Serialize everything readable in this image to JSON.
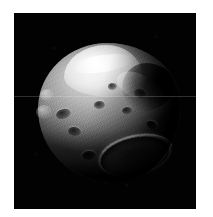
{
  "page": {
    "background_color": "#ffffff",
    "width": 213,
    "height": 217
  },
  "image_frame": {
    "label": "asteroid-nucleus-image",
    "background_color": "#020202",
    "left": 14,
    "top": 13,
    "width": 182,
    "height": 196,
    "caption": ""
  },
  "subject": {
    "name": "asteroid-nucleus",
    "description": "Irregular rocky body imaged in grayscale against black space background",
    "highlight_color": "#e2e2e2",
    "midtone_color": "#8f8f8f",
    "shadow_color": "#1a1a1a",
    "features": [
      {
        "name": "upper-dome-lobe",
        "tone": "bright"
      },
      {
        "name": "summit-ridge",
        "tone": "highlight"
      },
      {
        "name": "upper-right-scarp-shadow",
        "tone": "dark"
      },
      {
        "name": "lower-right-crater",
        "tone": "bright-rim"
      },
      {
        "name": "left-limb-bumps",
        "tone": "bright"
      },
      {
        "name": "surface-pits",
        "tone": "dark"
      }
    ]
  },
  "artifacts": {
    "scan_line": {
      "name": "horizontal-scan-line",
      "y": 96,
      "color": "#ffffff2e"
    }
  }
}
